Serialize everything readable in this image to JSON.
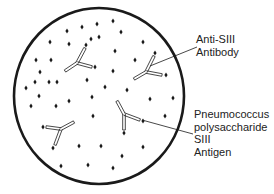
{
  "diagram": {
    "colors": {
      "background": "#ffffff",
      "stroke": "#1a1a1a",
      "text": "#222222"
    },
    "circle": {
      "cx": 99,
      "cy": 96,
      "rx": 85,
      "ry": 88,
      "stroke_width": 2.6
    },
    "labels": {
      "antibody": {
        "lines": [
          "Anti-SIII",
          "Antibody"
        ]
      },
      "antigen": {
        "lines": [
          "Pneumococcus",
          "polysaccharide",
          "SIII",
          "Antigen"
        ]
      }
    },
    "leader_lines": [
      {
        "name": "antibody-leader",
        "x1": 150,
        "y1": 66,
        "x2": 197,
        "y2": 47
      },
      {
        "name": "antigen-leader",
        "x1": 142,
        "y1": 120,
        "x2": 193,
        "y2": 134
      }
    ],
    "antibodies": [
      {
        "name": "antibody-1",
        "junction": [
          77,
          63
        ],
        "stem": [
          65,
          71
        ],
        "arms": [
          [
            85,
            48
          ],
          [
            92,
            67
          ]
        ],
        "antigens": [
          [
            86,
            45
          ],
          [
            95,
            67
          ]
        ]
      },
      {
        "name": "antibody-2",
        "junction": [
          146,
          72
        ],
        "stem": [
          134,
          79
        ],
        "arms": [
          [
            154,
            56
          ],
          [
            162,
            75
          ]
        ],
        "antigens": [
          [
            155,
            53
          ],
          [
            166,
            75
          ]
        ]
      },
      {
        "name": "antibody-3",
        "junction": [
          124,
          114
        ],
        "stem": [
          124,
          130
        ],
        "arms": [
          [
            117,
            101
          ],
          [
            140,
            120
          ]
        ],
        "antigens": [
          [
            124,
            133
          ],
          [
            143,
            121
          ]
        ]
      },
      {
        "name": "antibody-4",
        "junction": [
          61,
          129
        ],
        "stem": [
          74,
          122
        ],
        "arms": [
          [
            46,
            127
          ],
          [
            55,
            145
          ]
        ],
        "antigens": [
          [
            43,
            127
          ],
          [
            53,
            148
          ]
        ]
      }
    ],
    "free_antigens": [
      [
        67,
        31
      ],
      [
        82,
        27
      ],
      [
        97,
        24
      ],
      [
        113,
        21
      ],
      [
        121,
        32
      ],
      [
        50,
        42
      ],
      [
        69,
        44
      ],
      [
        91,
        39
      ],
      [
        99,
        37
      ],
      [
        143,
        42
      ],
      [
        115,
        51
      ],
      [
        36,
        60
      ],
      [
        51,
        60
      ],
      [
        135,
        60
      ],
      [
        40,
        72
      ],
      [
        113,
        71
      ],
      [
        35,
        82
      ],
      [
        49,
        82
      ],
      [
        57,
        82
      ],
      [
        87,
        80
      ],
      [
        26,
        88
      ],
      [
        105,
        87
      ],
      [
        127,
        90
      ],
      [
        39,
        96
      ],
      [
        92,
        97
      ],
      [
        69,
        101
      ],
      [
        150,
        99
      ],
      [
        173,
        98
      ],
      [
        31,
        106
      ],
      [
        56,
        106
      ],
      [
        93,
        116
      ],
      [
        165,
        116
      ],
      [
        143,
        147
      ],
      [
        79,
        146
      ],
      [
        101,
        146
      ],
      [
        122,
        156
      ],
      [
        61,
        166
      ],
      [
        88,
        165
      ],
      [
        113,
        168
      ]
    ]
  }
}
